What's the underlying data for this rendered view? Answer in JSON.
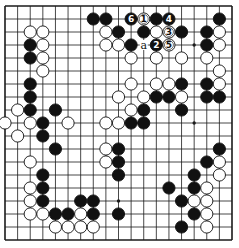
{
  "diagram": {
    "type": "go-board",
    "size": 19,
    "colors": {
      "background": "#ffffff",
      "line": "#1a1a1a",
      "black_stone": "#111111",
      "white_stone": "#ffffff"
    },
    "star_points": [
      [
        3,
        3
      ],
      [
        9,
        3
      ],
      [
        15,
        3
      ],
      [
        3,
        9
      ],
      [
        9,
        9
      ],
      [
        15,
        9
      ],
      [
        3,
        15
      ],
      [
        9,
        15
      ],
      [
        15,
        15
      ]
    ],
    "black_stones": [
      [
        7,
        1
      ],
      [
        8,
        1
      ],
      [
        12,
        1
      ],
      [
        17,
        1
      ],
      [
        9,
        2
      ],
      [
        11,
        2
      ],
      [
        14,
        2
      ],
      [
        16,
        2
      ],
      [
        2,
        3
      ],
      [
        10,
        3
      ],
      [
        16,
        3
      ],
      [
        2,
        4
      ],
      [
        14,
        6
      ],
      [
        16,
        6
      ],
      [
        2,
        6
      ],
      [
        2,
        7
      ],
      [
        12,
        7
      ],
      [
        13,
        7
      ],
      [
        16,
        7
      ],
      [
        17,
        7
      ],
      [
        2,
        8
      ],
      [
        4,
        8
      ],
      [
        11,
        8
      ],
      [
        14,
        8
      ],
      [
        3,
        9
      ],
      [
        10,
        9
      ],
      [
        11,
        9
      ],
      [
        3,
        10
      ],
      [
        4,
        11
      ],
      [
        9,
        11
      ],
      [
        17,
        11
      ],
      [
        9,
        12
      ],
      [
        16,
        12
      ],
      [
        3,
        13
      ],
      [
        9,
        13
      ],
      [
        15,
        13
      ],
      [
        3,
        14
      ],
      [
        13,
        14
      ],
      [
        15,
        14
      ],
      [
        3,
        15
      ],
      [
        6,
        15
      ],
      [
        7,
        15
      ],
      [
        14,
        15
      ],
      [
        4,
        16
      ],
      [
        5,
        16
      ],
      [
        7,
        16
      ],
      [
        9,
        16
      ],
      [
        15,
        16
      ],
      [
        14,
        17
      ]
    ],
    "white_stones": [
      [
        2,
        2
      ],
      [
        3,
        2
      ],
      [
        8,
        2
      ],
      [
        12,
        2
      ],
      [
        17,
        2
      ],
      [
        3,
        3
      ],
      [
        8,
        3
      ],
      [
        9,
        3
      ],
      [
        17,
        3
      ],
      [
        3,
        4
      ],
      [
        10,
        4
      ],
      [
        12,
        4
      ],
      [
        14,
        4
      ],
      [
        16,
        4
      ],
      [
        3,
        5
      ],
      [
        17,
        5
      ],
      [
        10,
        6
      ],
      [
        12,
        6
      ],
      [
        13,
        6
      ],
      [
        17,
        6
      ],
      [
        9,
        7
      ],
      [
        11,
        7
      ],
      [
        14,
        7
      ],
      [
        1,
        8
      ],
      [
        10,
        8
      ],
      [
        0,
        9
      ],
      [
        2,
        9
      ],
      [
        5,
        9
      ],
      [
        8,
        9
      ],
      [
        9,
        9
      ],
      [
        1,
        10
      ],
      [
        8,
        11
      ],
      [
        2,
        12
      ],
      [
        8,
        12
      ],
      [
        17,
        12
      ],
      [
        17,
        13
      ],
      [
        2,
        14
      ],
      [
        16,
        14
      ],
      [
        2,
        15
      ],
      [
        15,
        15
      ],
      [
        16,
        15
      ],
      [
        2,
        16
      ],
      [
        3,
        16
      ],
      [
        6,
        16
      ],
      [
        16,
        16
      ],
      [
        4,
        17
      ],
      [
        5,
        17
      ],
      [
        6,
        17
      ],
      [
        7,
        17
      ],
      [
        16,
        17
      ]
    ],
    "numbered_moves": [
      {
        "number": "1",
        "color": "white",
        "col": 11,
        "row": 1
      },
      {
        "number": "2",
        "color": "black",
        "col": 12,
        "row": 3
      },
      {
        "number": "3",
        "color": "white",
        "col": 13,
        "row": 2
      },
      {
        "number": "4",
        "color": "black",
        "col": 13,
        "row": 1
      },
      {
        "number": "5",
        "color": "white",
        "col": 13,
        "row": 3
      },
      {
        "number": "6",
        "color": "black",
        "col": 10,
        "row": 1
      }
    ],
    "letter_marks": [
      {
        "label": "a",
        "col": 11,
        "row": 3
      }
    ]
  }
}
